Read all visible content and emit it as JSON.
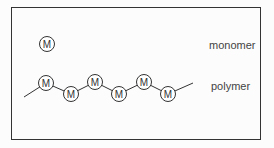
{
  "diagram": {
    "monomer": {
      "label": "monomer",
      "symbol": "M"
    },
    "polymer": {
      "label": "polymer",
      "unit_symbol": "M",
      "unit_count": 6
    },
    "colors": {
      "line": "#333333",
      "text": "#444444",
      "fill": "#ffffff"
    }
  }
}
